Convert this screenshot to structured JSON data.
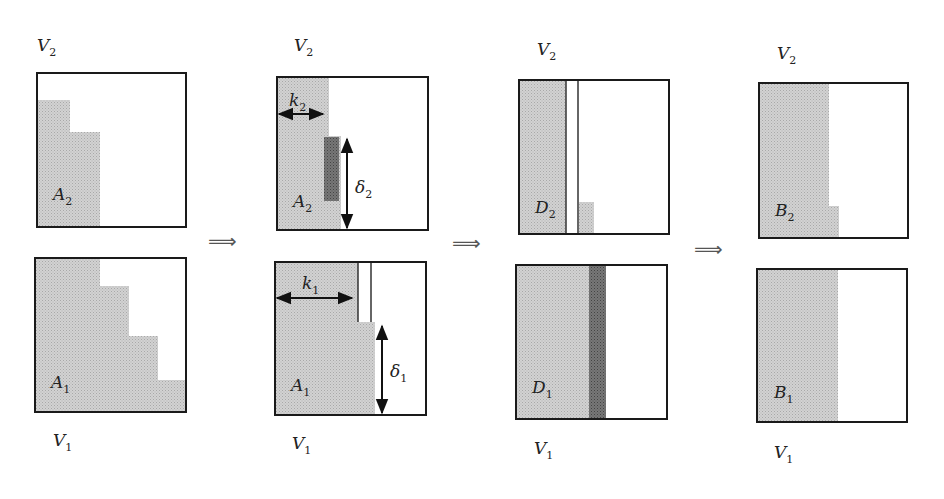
{
  "diagram": {
    "implies_symbol": "⟹",
    "colors": {
      "shade": "#c9c9c9",
      "dark": "#6e6e6e",
      "stroke": "#1a1a1a",
      "background": "#ffffff"
    },
    "panels": [
      {
        "id": "panel-1",
        "top": {
          "space": "V",
          "space_sub": "2",
          "set": "A",
          "set_sub": "2"
        },
        "bottom": {
          "space": "V",
          "space_sub": "1",
          "set": "A",
          "set_sub": "1"
        }
      },
      {
        "id": "panel-2",
        "top": {
          "space": "V",
          "space_sub": "2",
          "set": "A",
          "set_sub": "2",
          "width_label": "k",
          "width_sub": "2",
          "height_label": "δ",
          "height_sub": "2"
        },
        "bottom": {
          "space": "V",
          "space_sub": "1",
          "set": "A",
          "set_sub": "1",
          "width_label": "k",
          "width_sub": "1",
          "height_label": "δ",
          "height_sub": "1"
        }
      },
      {
        "id": "panel-3",
        "top": {
          "space": "V",
          "space_sub": "2",
          "set": "D",
          "set_sub": "2"
        },
        "bottom": {
          "space": "V",
          "space_sub": "1",
          "set": "D",
          "set_sub": "1"
        }
      },
      {
        "id": "panel-4",
        "top": {
          "space": "V",
          "space_sub": "2",
          "set": "B",
          "set_sub": "2"
        },
        "bottom": {
          "space": "V",
          "space_sub": "1",
          "set": "B",
          "set_sub": "1"
        }
      }
    ]
  }
}
